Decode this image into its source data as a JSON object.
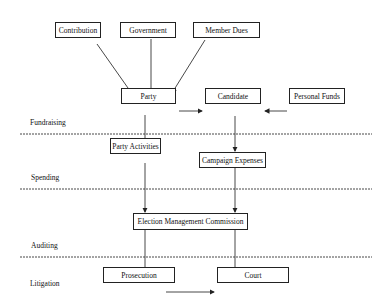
{
  "nodes": {
    "contribution": "Contribution",
    "government": "Government",
    "member_dues": "Member Dues",
    "party": "Party",
    "candidate": "Candidate",
    "personal_funds": "Personal Funds",
    "party_activities": "Party Activities",
    "campaign_expenses": "Campaign Expenses",
    "emc": "Election Management Commission",
    "prosecution": "Prosecution",
    "court": "Court"
  },
  "stages": {
    "fundraising": "Fundraising",
    "spending": "Spending",
    "auditing": "Auditing",
    "litigation": "Litigation"
  },
  "edges": [
    {
      "from": "Contribution",
      "to": "Party"
    },
    {
      "from": "Government",
      "to": "Party"
    },
    {
      "from": "Member Dues",
      "to": "Party"
    },
    {
      "from": "Party",
      "to": "Candidate"
    },
    {
      "from": "Personal Funds",
      "to": "Candidate"
    },
    {
      "from": "Party",
      "to": "Party Activities"
    },
    {
      "from": "Candidate",
      "to": "Campaign Expenses"
    },
    {
      "from": "Party Activities",
      "to": "Election Management Commission"
    },
    {
      "from": "Campaign Expenses",
      "to": "Election Management Commission"
    },
    {
      "from": "Election Management Commission",
      "to": "Prosecution"
    },
    {
      "from": "Election Management Commission",
      "to": "Court"
    },
    {
      "from": "Prosecution",
      "to": "Court"
    }
  ]
}
